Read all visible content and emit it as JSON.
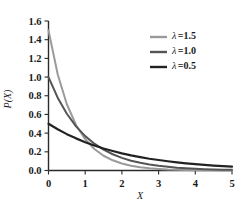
{
  "chart_data": {
    "type": "line",
    "title": "",
    "xlabel": "X",
    "ylabel": "P(X)",
    "xlim": [
      0,
      5
    ],
    "ylim": [
      0.0,
      1.6
    ],
    "grid": false,
    "legend_position": "top-right",
    "x_ticks": [
      "0",
      "1",
      "2",
      "3",
      "4",
      "5"
    ],
    "y_ticks": [
      "0.0",
      "0.2",
      "0.4",
      "0.6",
      "0.8",
      "1.0",
      "1.2",
      "1.4",
      "1.6"
    ],
    "x_tick_values": [
      0,
      1,
      2,
      3,
      4,
      5
    ],
    "y_tick_values": [
      0.0,
      0.2,
      0.4,
      0.6,
      0.8,
      1.0,
      1.2,
      1.4,
      1.6
    ],
    "x": [
      0,
      0.25,
      0.5,
      0.75,
      1,
      1.25,
      1.5,
      1.75,
      2,
      2.25,
      2.5,
      2.75,
      3,
      3.25,
      3.5,
      3.75,
      4,
      4.25,
      4.5,
      4.75,
      5
    ],
    "series": [
      {
        "name": "λ =1.5",
        "lambda": 1.5,
        "color": "#9a9a9a",
        "width": 2.0,
        "values": [
          1.5,
          1.031,
          0.709,
          0.487,
          0.335,
          0.23,
          0.158,
          0.109,
          0.075,
          0.051,
          0.035,
          0.024,
          0.017,
          0.011,
          0.008,
          0.005,
          0.004,
          0.003,
          0.002,
          0.001,
          0.001
        ]
      },
      {
        "name": "λ =1.0",
        "lambda": 1.0,
        "color": "#555555",
        "width": 2.0,
        "values": [
          1.0,
          0.779,
          0.607,
          0.472,
          0.368,
          0.287,
          0.223,
          0.174,
          0.135,
          0.105,
          0.082,
          0.064,
          0.05,
          0.039,
          0.03,
          0.024,
          0.018,
          0.014,
          0.011,
          0.009,
          0.007
        ]
      },
      {
        "name": "λ =0.5",
        "lambda": 0.5,
        "color": "#222222",
        "width": 2.2,
        "values": [
          0.5,
          0.441,
          0.389,
          0.344,
          0.303,
          0.268,
          0.236,
          0.209,
          0.184,
          0.162,
          0.143,
          0.126,
          0.112,
          0.099,
          0.087,
          0.077,
          0.068,
          0.06,
          0.053,
          0.046,
          0.041
        ]
      }
    ],
    "legend_entries": [
      {
        "lambda_symbol": "λ",
        "equals_value": "=1.5",
        "color": "#9a9a9a"
      },
      {
        "lambda_symbol": "λ",
        "equals_value": "=1.0",
        "color": "#555555"
      },
      {
        "lambda_symbol": "λ",
        "equals_value": "=0.5",
        "color": "#222222"
      }
    ]
  }
}
